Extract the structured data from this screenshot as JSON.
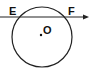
{
  "diagram": {
    "type": "circle-secant",
    "circle": {
      "center_label": "O",
      "stroke": "#222222"
    },
    "line": {
      "stroke": "#222222",
      "arrow": "right"
    },
    "points": [
      {
        "label": "E",
        "role": "intersection-left"
      },
      {
        "label": "F",
        "role": "intersection-right"
      },
      {
        "label": "O",
        "role": "center"
      }
    ]
  }
}
